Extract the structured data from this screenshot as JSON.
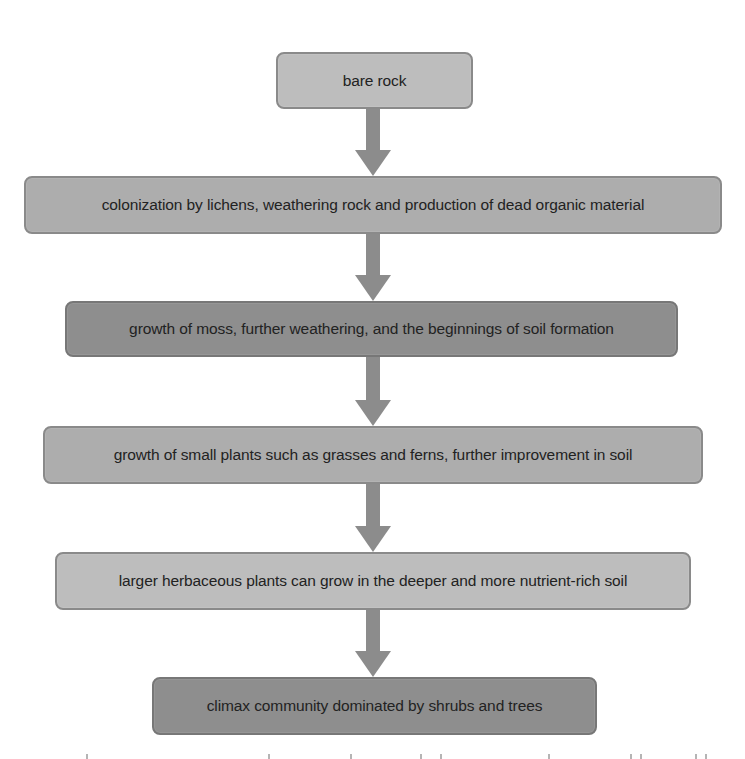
{
  "diagram": {
    "type": "flowchart",
    "direction": "top-to-bottom",
    "steps": [
      {
        "label": "bare rock",
        "shade": "#bdbdbd"
      },
      {
        "label": "colonization by lichens, weathering rock and production of dead organic material",
        "shade": "#adadad"
      },
      {
        "label": "growth of moss, further weathering, and the beginnings of soil formation",
        "shade": "#8e8e8e"
      },
      {
        "label": "growth of small plants such as grasses and ferns, further improvement in soil",
        "shade": "#adadad"
      },
      {
        "label": "larger herbaceous plants can grow in the deeper and more nutrient-rich soil",
        "shade": "#bdbdbd"
      },
      {
        "label": "climax community dominated by shrubs and trees",
        "shade": "#8e8e8e"
      }
    ],
    "arrow_color": "#8c8c8c",
    "arrow_icon": "down-arrow-icon"
  }
}
